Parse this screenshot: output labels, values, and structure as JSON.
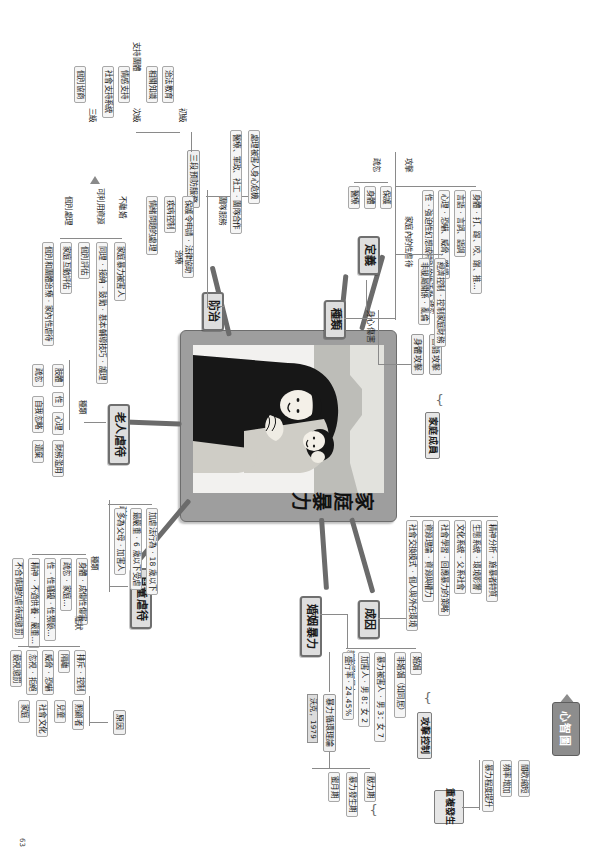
{
  "logo": {
    "label": "心智圖",
    "icon": "arrow-left-icon"
  },
  "page_number": "63",
  "center": {
    "title": "家庭暴力",
    "illustration": "woman-holding-child-illustration"
  },
  "branches": {
    "definition": {
      "label": "定義",
      "child": "身心傷害",
      "group_label": "疏忽",
      "items": [
        "身體攻擊",
        "言語攻擊"
      ],
      "target": "家庭成員"
    },
    "types": {
      "label": "種類",
      "groups": [
        {
          "label": "攻擊",
          "items": [
            "身體 ‧ 打、踢、咬、踹、推…",
            "言語 ‧ 言詞、語調",
            "心理 ‧ 恐嚇、威脅、嘲諷",
            "性 ‧ 強迫性幻想或特別的性活動"
          ]
        },
        {
          "label": "家庭內的性虐待",
          "items": [
            "經濟控制 ‧ 控制家庭財務",
            "非親屬關係 ‧ 亂倫"
          ]
        },
        {
          "label": "疏忽",
          "items": [
            "保護",
            "身體",
            "醫療"
          ]
        }
      ]
    },
    "causes": {
      "label": "成因",
      "items": [
        "精神分析 ‧ 施暴者特質",
        "生態系統 ‧ 環境影響",
        "文化系統 ‧ 父系社會",
        "社會學習 ‧ 回應暴力的策略",
        "資源理論 ‧ 資源與權力",
        "社會交換模式 ‧ 個人與外在環境"
      ]
    },
    "marital_violence": {
      "label": "婚姻暴力",
      "sub_label": "親密關係暴力",
      "relation_types": [
        "婚姻",
        "非婚姻（如同居）"
      ],
      "stats": [
        "暴力被害人 ‧ 男 3：女 7",
        "加害人 ‧ 男 8：女 2",
        "盛行率 ‧ 24.45%"
      ],
      "theory": {
        "name": "暴力循環理論",
        "citation": "沃克，1979",
        "phases": [
          "壓力期",
          "暴力發生期",
          "蜜月期"
        ],
        "outcome_label": "重複發生",
        "outcomes": [
          "間歇縮短",
          "頻率增加",
          "暴力程度提升"
        ],
        "attack_label": "攻擊控制"
      }
    },
    "prevention": {
      "label": "防治",
      "sub_nodes": [
        {
          "label": "團隊服務",
          "detail": "處理被害人身心危機",
          "members": "醫療、軍政、社工 ‧ 團隊合作"
        },
        {
          "label": "三段預防服務",
          "levels": [
            {
              "level": "初級",
              "items": [
                "治法教育",
                "相關知識"
              ]
            },
            {
              "level": "次級",
              "items": [
                "情感支持",
                "社會支持系統"
              ]
            },
            {
              "level": "三級",
              "items": [
                "個別協商"
              ]
            }
          ],
          "support_label": "支持團體"
        },
        {
          "label": "保護令申請 ‧ 法律協助",
          "detail": "法律協助"
        },
        {
          "label": "情緒問題的處理",
          "detail": "疾病控制",
          "tag": "治療"
        }
      ],
      "resources": {
        "label": "可利用資源",
        "items": [
          "家庭暴力被害人",
          "不離婚"
        ],
        "handle": [
          "同理 ‧ 接納 ‧ 鼓勵 ‧ 基本輔導技巧 ‧ 護理",
          "個別評估",
          "家庭互動評估",
          "個別和團體治療 ‧ 家內性虐待"
        ],
        "process_label": "個別處理",
        "arrow": "arrow-left-icon"
      }
    },
    "elder_abuse": {
      "label": "老人虐待",
      "types_label": "種類",
      "items": [
        "肢體",
        "性",
        "心理",
        "財務濫用",
        "疏忽",
        "自我忽略",
        "遺棄"
      ]
    },
    "child_abuse": {
      "label": "兒童虐待",
      "definition_group": {
        "label": "疏忽",
        "items": [
          "加虐法行為 ‧ 18 歲以下",
          "最嚴重 ‧ 6 歲以下受虐",
          "多為父母 ‧ 加害人"
        ]
      },
      "types_label": "種類",
      "types": [
        "身體 ‧ 成傷性傷害",
        "疏忽 ‧ 家庭…",
        "性 ‧ 性騷擾 ‧ 性猥褻…",
        "精神 ‧ 不適供養 ‧ 嚴重…",
        "不合情理的虐待或懲罰"
      ],
      "symptoms_label": "症狀",
      "symptoms": [
        "排斥 ‧ 控制",
        "隔離",
        "威脅 ‧ 恐嚇",
        "忽視 ‧ 拒絕",
        "藐視懲罰"
      ],
      "reasons_label": "原因",
      "reasons": [
        "照顧者",
        "兒童",
        "社會文化",
        "家庭"
      ]
    }
  },
  "colors": {
    "node_fill": "#e9e9e9",
    "node_border": "#8d8d8d",
    "trunk": "#6b6b6b",
    "card": "#9e9e9e"
  }
}
